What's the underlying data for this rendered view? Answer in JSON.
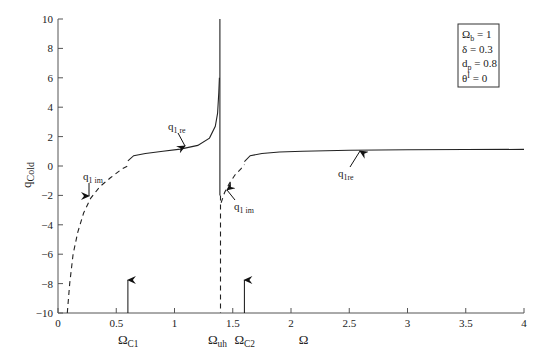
{
  "chart_data": {
    "type": "line",
    "title": "",
    "xlabel": "Ω",
    "ylabel": "q_Cold",
    "xlim": [
      0,
      4
    ],
    "ylim": [
      -10,
      10
    ],
    "grid": false,
    "x_ticks": [
      "0",
      "0.5",
      "1",
      "1.5",
      "2",
      "2.5",
      "3",
      "3.5",
      "4"
    ],
    "y_ticks": [
      "10",
      "8",
      "6",
      "4",
      "2",
      "0",
      "−2",
      "−4",
      "−6",
      "−8",
      "−10"
    ],
    "parameters_box": {
      "lines": [
        {
          "base": "Ω",
          "sub": "b",
          "value": " = 1"
        },
        {
          "base": "δ",
          "sub": "",
          "value": " = 0.3"
        },
        {
          "base": "d",
          "sub": "p",
          "value": " = 0.8"
        },
        {
          "base": "θ",
          "sup": "I",
          "value": " = 0"
        }
      ]
    },
    "series": [
      {
        "name": "q1 im (branch 1, dashed)",
        "style": "dashed",
        "x": [
          0.08,
          0.1,
          0.13,
          0.17,
          0.22,
          0.28,
          0.36,
          0.45,
          0.55,
          0.6
        ],
        "y": [
          -10,
          -8,
          -6,
          -4.5,
          -3.2,
          -2.2,
          -1.4,
          -0.8,
          -0.2,
          0
        ]
      },
      {
        "name": "q1 re (branch 1, solid)",
        "style": "solid",
        "x": [
          0.6,
          0.65,
          0.75,
          0.9,
          1.05,
          1.2,
          1.3,
          1.35,
          1.37,
          1.38,
          1.385
        ],
        "y": [
          0.35,
          0.7,
          0.85,
          1.0,
          1.15,
          1.4,
          1.9,
          2.7,
          3.6,
          5.0,
          6.0
        ]
      },
      {
        "name": "vertical at Ω_uh (solid upper)",
        "style": "solid",
        "x": [
          1.39,
          1.39
        ],
        "y": [
          10,
          -2
        ]
      },
      {
        "name": "vertical at Ω_uh (dashed lower)",
        "style": "dashed",
        "x": [
          1.395,
          1.395
        ],
        "y": [
          -2,
          -10
        ]
      },
      {
        "name": "q1 im (branch 2, dashed)",
        "style": "dashed",
        "x": [
          1.4,
          1.43,
          1.47,
          1.52,
          1.57,
          1.6
        ],
        "y": [
          -2.5,
          -1.8,
          -1.2,
          -0.6,
          -0.2,
          0.1
        ]
      },
      {
        "name": "q1re (branch 2, solid)",
        "style": "solid",
        "x": [
          1.6,
          1.65,
          1.75,
          1.9,
          2.1,
          2.5,
          3.0,
          3.5,
          4.0
        ],
        "y": [
          0.3,
          0.7,
          0.85,
          0.95,
          1.0,
          1.07,
          1.1,
          1.12,
          1.13
        ]
      }
    ],
    "annotations": [
      {
        "label": "q",
        "sub": "1 re",
        "x": 1.1,
        "y": 1.1
      },
      {
        "label": "q",
        "sub": "1 im",
        "x": 0.27,
        "y": -2.3
      },
      {
        "label": "q",
        "sub": "1 im",
        "x": 1.4,
        "y": -1.6
      },
      {
        "label": "q",
        "sub": "1re",
        "x": 2.6,
        "y": 1.05
      }
    ],
    "markers": [
      {
        "label": "Ω",
        "sub": "C1",
        "x": 0.6,
        "type": "up-arrow"
      },
      {
        "label": "Ω",
        "sub": "C2",
        "x": 1.6,
        "type": "up-arrow"
      },
      {
        "label": "Ω",
        "sub": "uh",
        "x": 1.39,
        "type": "axis-label"
      }
    ]
  }
}
